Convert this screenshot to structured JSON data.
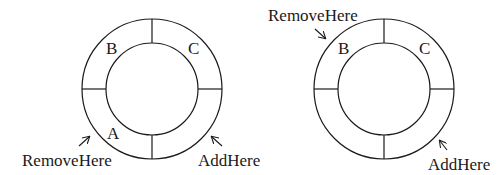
{
  "diagrams": [
    {
      "name": "left-buffer",
      "slots": {
        "top_left": "B",
        "top_right": "C",
        "bottom_left": "A",
        "bottom_right": ""
      },
      "remove_label": "RemoveHere",
      "add_label": "AddHere"
    },
    {
      "name": "right-buffer",
      "slots": {
        "top_left": "B",
        "top_right": "C",
        "bottom_left": "",
        "bottom_right": ""
      },
      "remove_label": "RemoveHere",
      "add_label": "AddHere"
    }
  ],
  "colors": {
    "stroke": "#1a1a1a",
    "background": "#ffffff"
  }
}
